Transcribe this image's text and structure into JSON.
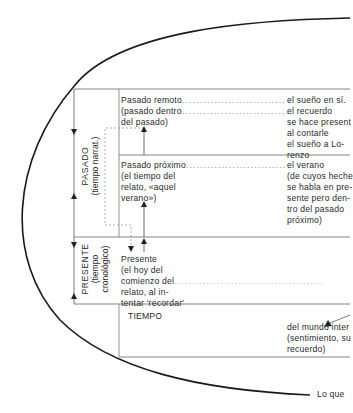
{
  "diagram": {
    "sections": {
      "pasado": {
        "label": "PASADO",
        "sublabel": "(tiempo narrat.)"
      },
      "presente": {
        "label": "PRESENTE",
        "sublabel_1": "(tiempo",
        "sublabel_2": "cronológico)"
      }
    },
    "rows": [
      {
        "left_lines": [
          "Pasado remoto",
          "(pasado dentro",
          "del pasado)"
        ],
        "right_lines": [
          "el sueño en sí.",
          "el recuerdo",
          "se hace present",
          "al contarle",
          "el sueño a Lo-",
          "renzo"
        ]
      },
      {
        "left_lines": [
          "Pasado próximo",
          "(el tiempo del",
          "relato, «aquel",
          "verano»)"
        ],
        "right_lines": [
          "el verano",
          "(de cuyos heche",
          "se habla en pre-",
          "sente pero den-",
          "tro del pasado",
          "próximo)"
        ]
      },
      {
        "left_lines": [
          "Presente",
          "(el hoy del",
          "comienzo del",
          "relato, al in-",
          "tentar 'recordar'"
        ],
        "right_lines": []
      }
    ],
    "tiempo_box": {
      "label": "TIEMPO",
      "right_lines": [
        "del mundo inter",
        "(sentimiento, su",
        "recuerdo)"
      ]
    },
    "footer_label": "Lo que"
  }
}
